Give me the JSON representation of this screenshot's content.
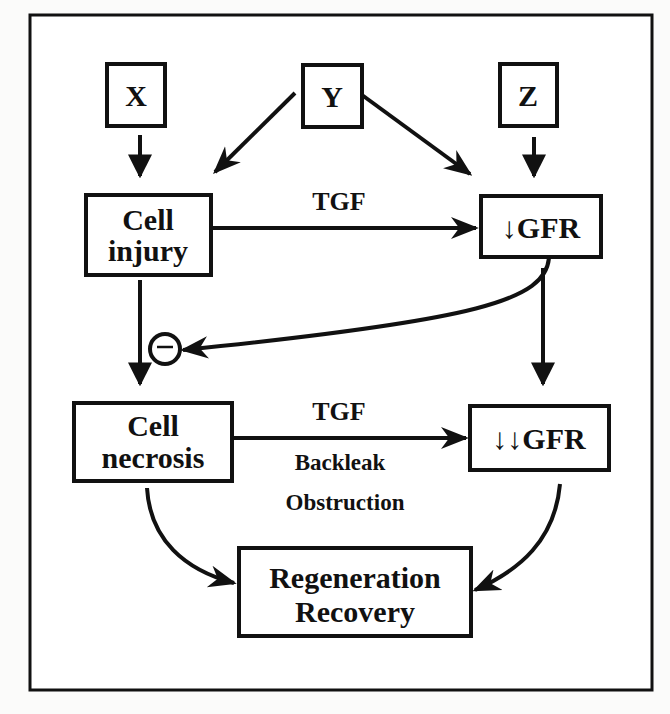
{
  "diagram": {
    "nodes": {
      "x": {
        "label": "X"
      },
      "y": {
        "label": "Y"
      },
      "z": {
        "label": "Z"
      },
      "cell_injury": {
        "line1": "Cell",
        "line2": "injury"
      },
      "gfr_down": {
        "arrow": "↓",
        "label": "GFR"
      },
      "cell_necrosis": {
        "line1": "Cell",
        "line2": "necrosis"
      },
      "gfr_down_down": {
        "arrow": "↓↓",
        "label": "GFR"
      },
      "regeneration": {
        "line1": "Regeneration",
        "line2": "Recovery"
      }
    },
    "edge_labels": {
      "injury_to_gfr": "TGF",
      "necrosis_to_gfr": "TGF",
      "backleak": "Backleak",
      "obstruction": "Obstruction"
    },
    "inhibition_symbol": "−",
    "edges": [
      {
        "from": "X",
        "to": "Cell injury"
      },
      {
        "from": "Y",
        "to": "Cell injury"
      },
      {
        "from": "Y",
        "to": "↓GFR"
      },
      {
        "from": "Z",
        "to": "↓GFR"
      },
      {
        "from": "Cell injury",
        "to": "↓GFR",
        "label": "TGF"
      },
      {
        "from": "Cell injury",
        "to": "Cell necrosis"
      },
      {
        "from": "↓GFR",
        "to": "Cell injury→Cell necrosis",
        "type": "inhibition"
      },
      {
        "from": "↓GFR",
        "to": "↓↓GFR"
      },
      {
        "from": "Cell necrosis",
        "to": "↓↓GFR",
        "label": "TGF"
      },
      {
        "from": "Cell necrosis",
        "to": "Regeneration Recovery"
      },
      {
        "from": "↓↓GFR",
        "to": "Regeneration Recovery"
      }
    ]
  }
}
